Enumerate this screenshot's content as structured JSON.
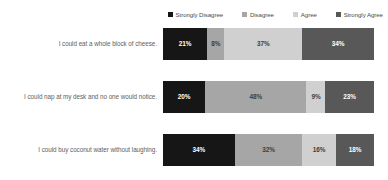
{
  "chart_data": {
    "type": "bar",
    "subtype": "stacked-horizontal-100percent",
    "title": "",
    "xlabel": "",
    "ylabel": "",
    "grid": false,
    "legend_position": "top-right",
    "xlim": [
      0,
      100
    ],
    "value_suffix": "%",
    "categories": [
      "I could eat a whole block of cheese.",
      "I could nap at my desk and no one would notice.",
      "I could buy coconut water without laughing."
    ],
    "series": [
      {
        "name": "Strongly Disagree",
        "color": "#161616",
        "values": [
          21,
          20,
          34
        ]
      },
      {
        "name": "Disagree",
        "color": "#a6a6a6",
        "values": [
          8,
          48,
          32
        ]
      },
      {
        "name": "Agree",
        "color": "#d0d0d0",
        "values": [
          37,
          9,
          16
        ]
      },
      {
        "name": "Strongly Agree",
        "color": "#585858",
        "values": [
          34,
          23,
          18
        ]
      }
    ],
    "rows": [
      {
        "label": "I could eat a whole block of cheese.",
        "segments": [
          {
            "series": "Strongly Disagree",
            "value": 21,
            "label": "21%",
            "color": "#161616",
            "text_on": "dark"
          },
          {
            "series": "Disagree",
            "value": 8,
            "label": "8%",
            "color": "#a6a6a6",
            "text_on": "light"
          },
          {
            "series": "Agree",
            "value": 37,
            "label": "37%",
            "color": "#d0d0d0",
            "text_on": "light"
          },
          {
            "series": "Strongly Agree",
            "value": 34,
            "label": "34%",
            "color": "#585858",
            "text_on": "dark"
          }
        ]
      },
      {
        "label": "I could nap at my desk and no one would notice.",
        "segments": [
          {
            "series": "Strongly Disagree",
            "value": 20,
            "label": "20%",
            "color": "#161616",
            "text_on": "dark"
          },
          {
            "series": "Disagree",
            "value": 48,
            "label": "48%",
            "color": "#a6a6a6",
            "text_on": "light"
          },
          {
            "series": "Agree",
            "value": 9,
            "label": "9%",
            "color": "#d0d0d0",
            "text_on": "light"
          },
          {
            "series": "Strongly Agree",
            "value": 23,
            "label": "23%",
            "color": "#585858",
            "text_on": "dark"
          }
        ]
      },
      {
        "label": "I could buy coconut water without laughing.",
        "segments": [
          {
            "series": "Strongly Disagree",
            "value": 34,
            "label": "34%",
            "color": "#161616",
            "text_on": "dark"
          },
          {
            "series": "Disagree",
            "value": 32,
            "label": "32%",
            "color": "#a6a6a6",
            "text_on": "light"
          },
          {
            "series": "Agree",
            "value": 16,
            "label": "16%",
            "color": "#d0d0d0",
            "text_on": "light"
          },
          {
            "series": "Strongly Agree",
            "value": 18,
            "label": "18%",
            "color": "#585858",
            "text_on": "dark"
          }
        ]
      }
    ]
  },
  "legend": {
    "items": [
      {
        "label": "Strongly Disagree",
        "color": "#161616"
      },
      {
        "label": "Disagree",
        "color": "#a6a6a6"
      },
      {
        "label": "Agree",
        "color": "#d0d0d0"
      },
      {
        "label": "Strongly Agree",
        "color": "#585858"
      }
    ]
  }
}
